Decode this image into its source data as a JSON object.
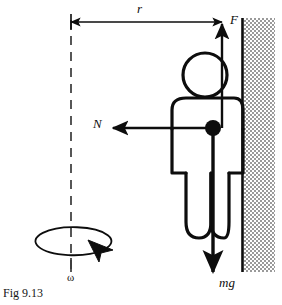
{
  "figure": {
    "caption": "Fig 9.13",
    "colors": {
      "ink": "#0d0d0d",
      "wall_hatch": "#9a9a9a",
      "background": "#ffffff"
    }
  },
  "labels": {
    "radius": "r",
    "friction_force": "F",
    "normal_force": "N",
    "weight": "mg",
    "angular_velocity": "ω"
  },
  "annotations": {
    "radius_description": "Radius from rotation axis to the wall",
    "friction_description": "Upward friction force on the person from the wall",
    "normal_description": "Inward normal force from the wall toward the axis",
    "weight_description": "Downward weight of the person",
    "omega_description": "Angular velocity of the rotating drum about the vertical dashed axis"
  },
  "elements": {
    "axis": "vertical-dashed-rotation-axis",
    "wall": "hatched-vertical-wall",
    "person": "stick-figure-person",
    "center_of_mass": "center-of-mass-dot",
    "rotation_ellipse": "rotation-direction-ellipse"
  }
}
